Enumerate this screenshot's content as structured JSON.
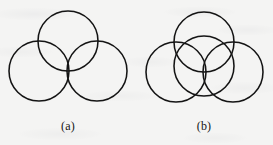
{
  "figure": {
    "kind": "line-drawing",
    "background_color": "#f4f4f3",
    "stroke_color": "#141414",
    "stroke_width": 1.55,
    "panels": [
      {
        "id": "panel-a",
        "label": "(a)",
        "label_x": 68,
        "label_y": 130,
        "arrangement": "three mutually overlapping circles in a triangular trefoil, each passing near the others' centres",
        "circles": [
          {
            "name": "top-circle",
            "cx": 68,
            "cy": 41,
            "r": 30
          },
          {
            "name": "bottom-left-circle",
            "cx": 39,
            "cy": 71,
            "r": 30
          },
          {
            "name": "bottom-right-circle",
            "cx": 97,
            "cy": 71,
            "r": 30
          }
        ]
      },
      {
        "id": "panel-b",
        "label": "(b)",
        "label_x": 204,
        "label_y": 130,
        "arrangement": "three mutually tangent outer circles with a central circle overlapping all three",
        "circles": [
          {
            "name": "top-circle",
            "cx": 204,
            "cy": 42,
            "r": 30
          },
          {
            "name": "bottom-left-circle",
            "cx": 176,
            "cy": 72,
            "r": 30
          },
          {
            "name": "bottom-right-circle",
            "cx": 233,
            "cy": 72,
            "r": 30
          },
          {
            "name": "center-circle",
            "cx": 204,
            "cy": 66,
            "r": 30
          }
        ]
      }
    ]
  },
  "captions": {
    "panel_a_label": "(a)",
    "panel_b_label": "(b)"
  }
}
